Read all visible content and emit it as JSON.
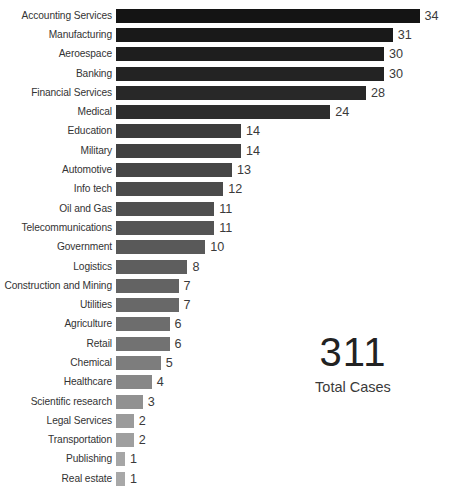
{
  "chart_data": {
    "type": "bar",
    "orientation": "horizontal",
    "title": "",
    "subtitle": "",
    "xlabel": "",
    "ylabel": "",
    "grid": false,
    "legend": null,
    "xlim": [
      0,
      34
    ],
    "categories": [
      "Accounting Services",
      "Manufacturing",
      "Aeroespace",
      "Banking",
      "Financial Services",
      "Medical",
      "Education",
      "Military",
      "Automotive",
      "Info tech",
      "Oil and Gas",
      "Telecommunications",
      "Government",
      "Logistics",
      "Construction and Mining",
      "Utilities",
      "Agriculture",
      "Retail",
      "Chemical",
      "Healthcare",
      "Scientific research",
      "Legal Services",
      "Transportation",
      "Publishing",
      "Real estate"
    ],
    "values": [
      34,
      31,
      30,
      30,
      28,
      24,
      14,
      14,
      13,
      12,
      11,
      11,
      10,
      8,
      7,
      7,
      6,
      6,
      5,
      4,
      3,
      2,
      2,
      1,
      1
    ],
    "bar_colors": [
      "#141414",
      "#191919",
      "#1e1e1e",
      "#232323",
      "#282828",
      "#2e2e2e",
      "#3c3c3c",
      "#414141",
      "#464646",
      "#4b4b4b",
      "#4f4f4f",
      "#545454",
      "#595959",
      "#5e5e5e",
      "#636363",
      "#686868",
      "#6d6d6d",
      "#727272",
      "#7d7d7d",
      "#878787",
      "#919191",
      "#9b9b9b",
      "#9f9f9f",
      "#a6a6a6",
      "#a8a8a8"
    ]
  },
  "summary": {
    "total_value": "311",
    "total_caption": "Total Cases"
  },
  "axis": {
    "px_per_unit": 8.93,
    "bar_origin_x": 120
  }
}
